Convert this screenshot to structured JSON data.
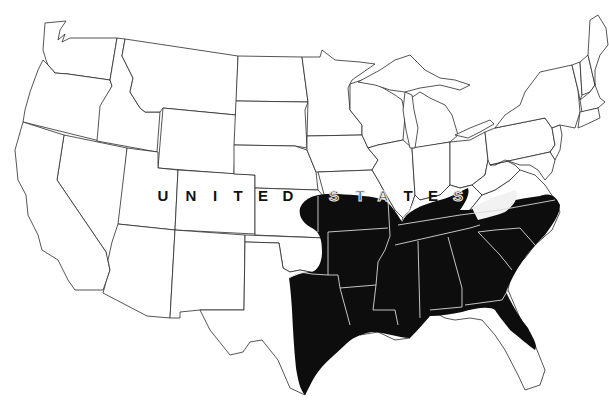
{
  "map": {
    "title": "",
    "country_label": "UNITED STATES",
    "label_letters_plain": [
      "U",
      "N",
      "I",
      "T",
      "E",
      "D"
    ],
    "label_letters_on_range": [
      "S",
      "T",
      "A",
      "T",
      "E",
      "S"
    ],
    "legend": [],
    "colors": {
      "land": "#ffffff",
      "border": "#2a2a2a",
      "range_fill": "#0d0d0d",
      "range_inner_border": "#d8d8d8",
      "background": "#ffffff"
    },
    "shaded_region_description": "Southeastern United States range: east Texas, eastern Oklahoma, southern Kansas fringe, southern Missouri, Arkansas, Louisiana, Mississippi, Alabama, Georgia, Tennessee, Kentucky, southern Illinois/Indiana/Ohio, South Carolina, North Carolina, eastern Virginia, northern Florida"
  }
}
